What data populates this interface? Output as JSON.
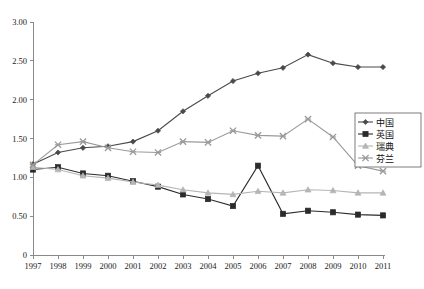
{
  "chart_data": {
    "type": "line",
    "title": "",
    "xlabel": "",
    "ylabel": "",
    "grid": false,
    "legend_position": "right",
    "ylim": [
      0,
      3.0
    ],
    "ytick_labels": [
      "3.00",
      "2.50",
      "2.00",
      "1.50",
      "1.00",
      "0.50",
      "0"
    ],
    "ytick_values": [
      3.0,
      2.5,
      2.0,
      1.5,
      1.0,
      0.5,
      0
    ],
    "categories": [
      "1997",
      "1998",
      "1999",
      "2000",
      "2001",
      "2002",
      "2003",
      "2004",
      "2005",
      "2006",
      "2007",
      "2008",
      "2009",
      "2010",
      "2011"
    ],
    "x": [
      1997,
      1998,
      1999,
      2000,
      2001,
      2002,
      2003,
      2004,
      2005,
      2006,
      2007,
      2008,
      2009,
      2010,
      2011
    ],
    "series": [
      {
        "name": "中国",
        "color": "#4a4a4a",
        "marker": "diamond",
        "values": [
          1.17,
          1.32,
          1.38,
          1.4,
          1.46,
          1.6,
          1.85,
          2.05,
          2.24,
          2.34,
          2.41,
          2.58,
          2.47,
          2.42,
          2.42
        ]
      },
      {
        "name": "英国",
        "color": "#2b2b2b",
        "marker": "square",
        "values": [
          1.1,
          1.13,
          1.05,
          1.02,
          0.95,
          0.88,
          0.78,
          0.72,
          0.63,
          1.15,
          0.53,
          0.57,
          0.55,
          0.52,
          0.51
        ]
      },
      {
        "name": "瑞典",
        "color": "#b5b5b5",
        "marker": "triangle",
        "values": [
          1.13,
          1.1,
          1.02,
          0.99,
          0.94,
          0.9,
          0.84,
          0.8,
          0.78,
          0.82,
          0.8,
          0.84,
          0.83,
          0.8,
          0.8
        ]
      },
      {
        "name": "芬兰",
        "color": "#9a9a9a",
        "marker": "cross",
        "values": [
          1.16,
          1.42,
          1.46,
          1.38,
          1.33,
          1.32,
          1.46,
          1.45,
          1.6,
          1.54,
          1.53,
          1.75,
          1.52,
          1.15,
          1.08
        ]
      }
    ]
  },
  "legend": {
    "entries": [
      {
        "label": "中国"
      },
      {
        "label": "英国"
      },
      {
        "label": "瑞典"
      },
      {
        "label": "芬兰"
      }
    ]
  }
}
